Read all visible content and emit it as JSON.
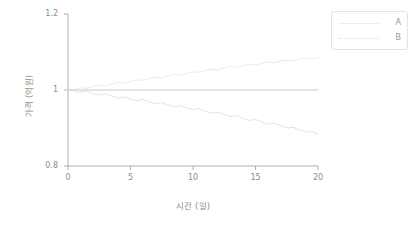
{
  "chart_data": {
    "type": "line",
    "title": "",
    "xlabel": "시간 (일)",
    "ylabel": "가격 (억원)",
    "xlim": [
      0,
      20
    ],
    "ylim": [
      0.8,
      1.2
    ],
    "xticks": [
      "0",
      "5",
      "10",
      "15",
      "20"
    ],
    "xtick_values": [
      0,
      5,
      10,
      15,
      20
    ],
    "yticks": [
      "1.2",
      "1",
      "0.8"
    ],
    "ytick_values": [
      1.2,
      1.0,
      0.8
    ],
    "grid": false,
    "legend_position": "upper right outside",
    "series": [
      {
        "name": "A",
        "style": "solid",
        "color": "#ededed",
        "x": [
          0,
          0.5,
          1,
          1.5,
          2,
          2.5,
          3,
          3.5,
          4,
          4.5,
          5,
          5.5,
          6,
          6.5,
          7,
          7.5,
          8,
          8.5,
          9,
          9.5,
          10,
          10.5,
          11,
          11.5,
          12,
          12.5,
          13,
          13.5,
          14,
          14.5,
          15,
          15.5,
          16,
          16.5,
          17,
          17.5,
          18,
          18.5,
          19,
          19.5,
          20
        ],
        "values": [
          1.0,
          1.002,
          1.006,
          1.004,
          1.009,
          1.013,
          1.011,
          1.016,
          1.02,
          1.018,
          1.023,
          1.027,
          1.025,
          1.03,
          1.034,
          1.032,
          1.037,
          1.041,
          1.039,
          1.044,
          1.048,
          1.046,
          1.051,
          1.055,
          1.053,
          1.058,
          1.062,
          1.06,
          1.064,
          1.068,
          1.066,
          1.07,
          1.074,
          1.072,
          1.076,
          1.079,
          1.077,
          1.081,
          1.084,
          1.081,
          1.085
        ]
      },
      {
        "name": "B",
        "style": "dotted",
        "color": "#dcdcdc",
        "x": [
          0,
          0.5,
          1,
          1.5,
          2,
          2.5,
          3,
          3.5,
          4,
          4.5,
          5,
          5.5,
          6,
          6.5,
          7,
          7.5,
          8,
          8.5,
          9,
          9.5,
          10,
          10.5,
          11,
          11.5,
          12,
          12.5,
          13,
          13.5,
          14,
          14.5,
          15,
          15.5,
          16,
          16.5,
          17,
          17.5,
          18,
          18.5,
          19,
          19.5,
          20
        ],
        "values": [
          1.0,
          0.998,
          0.994,
          0.997,
          0.991,
          0.987,
          0.99,
          0.984,
          0.979,
          0.982,
          0.976,
          0.972,
          0.975,
          0.969,
          0.964,
          0.967,
          0.961,
          0.956,
          0.959,
          0.953,
          0.948,
          0.951,
          0.944,
          0.939,
          0.942,
          0.936,
          0.93,
          0.933,
          0.926,
          0.92,
          0.923,
          0.916,
          0.91,
          0.913,
          0.906,
          0.9,
          0.902,
          0.895,
          0.889,
          0.891,
          0.884
        ]
      },
      {
        "name": "baseline",
        "style": "solid",
        "color": "#c9c9c9",
        "x": [
          0,
          20
        ],
        "values": [
          1.0,
          1.0
        ]
      }
    ],
    "legend": [
      {
        "label": "A",
        "style": "solid"
      },
      {
        "label": "B",
        "style": "dotted"
      }
    ]
  }
}
